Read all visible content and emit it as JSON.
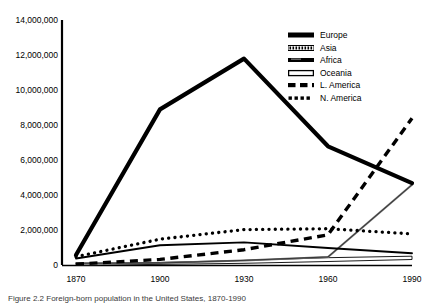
{
  "caption": "Figure 2.2  Foreign-born population in the United States, 1870-1990",
  "chart_data": {
    "type": "line",
    "title": "",
    "xlabel": "",
    "ylabel": "",
    "x": [
      1870,
      1900,
      1930,
      1960,
      1990
    ],
    "xticks": [
      "1870",
      "1900",
      "1930",
      "1960",
      "1990"
    ],
    "xlim": [
      1870,
      1990
    ],
    "ylim": [
      0,
      14000000
    ],
    "yticks": [
      0,
      2000000,
      4000000,
      6000000,
      8000000,
      10000000,
      12000000,
      14000000
    ],
    "ytick_labels": [
      "0",
      "2,000,000",
      "4,000,000",
      "6,000,000",
      "8,000,000",
      "10,000,000",
      "12,000,000",
      "14,000,000"
    ],
    "grid": false,
    "legend_position": "top-right",
    "series": [
      {
        "name": "Europe",
        "style": "thick-solid",
        "color": "#000000",
        "values": [
          600000,
          8900000,
          11800000,
          6800000,
          4700000
        ]
      },
      {
        "name": "Asia",
        "style": "thin-gray-solid",
        "color": "#6e6e6e",
        "values": [
          130000,
          140000,
          290000,
          490000,
          4600000
        ]
      },
      {
        "name": "Africa",
        "style": "thin-solid",
        "color": "#000000",
        "values": [
          400000,
          1150000,
          1320000,
          1000000,
          700000
        ]
      },
      {
        "name": "Oceania",
        "style": "hollow-outline",
        "color": "#000000",
        "values": [
          60000,
          90000,
          120000,
          160000,
          500000
        ]
      },
      {
        "name": "L. America",
        "style": "dashed",
        "color": "#000000",
        "values": [
          80000,
          350000,
          900000,
          1750000,
          8400000
        ]
      },
      {
        "name": "N. America",
        "style": "dotted",
        "color": "#000000",
        "values": [
          500000,
          1500000,
          2050000,
          2100000,
          1800000
        ]
      }
    ]
  },
  "legend": {
    "items": [
      {
        "label": "Europe",
        "swatch": "thick-solid-swatch"
      },
      {
        "label": "Asia",
        "swatch": "hatched-swatch"
      },
      {
        "label": "Africa",
        "swatch": "medium-solid-swatch"
      },
      {
        "label": "Oceania",
        "swatch": "hollow-swatch"
      },
      {
        "label": "L. America",
        "swatch": "dashed-swatch"
      },
      {
        "label": "N. America",
        "swatch": "dotted-swatch"
      }
    ]
  }
}
